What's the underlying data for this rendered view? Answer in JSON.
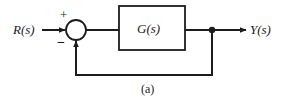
{
  "figure": {
    "caption": "(a)",
    "type": "control-system-block-diagram",
    "stroke_color": "#1c1c1c",
    "background_color": "#ffffff"
  },
  "labels": {
    "input_signal": "R(s)",
    "output_signal": "Y(s)",
    "transfer_function": "G(s)",
    "sum_positive": "+",
    "sum_negative": "−"
  },
  "nodes": {
    "summing_junction": {
      "name": "summing-junction",
      "cx": 76,
      "cy": 30,
      "r": 10
    },
    "plant_block": {
      "name": "plant-block",
      "x": 119,
      "y": 6,
      "width": 66,
      "height": 44,
      "label": "G(s)"
    },
    "takeoff_point": {
      "name": "takeoff-point",
      "cx": 212,
      "cy": 30,
      "r": 3
    }
  },
  "edges": [
    {
      "name": "input-to-sum",
      "from": "R(s)",
      "to": "summing-junction",
      "arrow": true
    },
    {
      "name": "sum-to-plant",
      "from": "summing-junction",
      "to": "plant-block",
      "arrow": false
    },
    {
      "name": "plant-to-takeoff",
      "from": "plant-block",
      "to": "takeoff-point",
      "arrow": false
    },
    {
      "name": "takeoff-to-output",
      "from": "takeoff-point",
      "to": "Y(s)",
      "arrow": true
    },
    {
      "name": "feedback-path",
      "from": "takeoff-point",
      "to": "summing-junction",
      "arrow": true,
      "sign": "−"
    }
  ]
}
